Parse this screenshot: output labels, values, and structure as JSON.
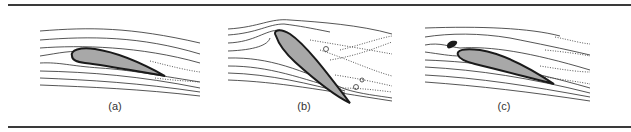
{
  "figure": {
    "panels": [
      {
        "id": "a",
        "label": "(a)",
        "description": "Airfoil at low angle of attack: attached streamlined flow with thin wake"
      },
      {
        "id": "b",
        "label": "(b)",
        "description": "Airfoil at high angle of attack: flow separation and turbulent wake (stall)"
      },
      {
        "id": "c",
        "label": "(c)",
        "description": "Airfoil with leading-edge slat: attached flow at higher angle"
      }
    ],
    "colors": {
      "airfoil_fill": "#a8a8a8",
      "outline": "#1a1a1a",
      "streamline": "#2a2a2a",
      "rule": "#3a3a3a"
    }
  }
}
